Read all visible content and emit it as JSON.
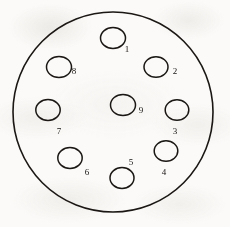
{
  "diagram": {
    "type": "connector-pin-layout",
    "stroke_color": "#1a1714",
    "fill_color": "#fbfaf8",
    "background_color": "#fbfaf8",
    "shell": {
      "label": "connector-shell-outline",
      "shape": "circle",
      "cx": 113,
      "cy": 112,
      "r": 100,
      "stroke_width": 1.6
    },
    "pins": [
      {
        "number": "1",
        "cx": 113,
        "cy": 38,
        "rx": 12.5,
        "ry": 10.5,
        "label_x": 127,
        "label_y": 52
      },
      {
        "number": "2",
        "cx": 156,
        "cy": 67,
        "rx": 12.0,
        "ry": 10.2,
        "label_x": 175,
        "label_y": 74
      },
      {
        "number": "3",
        "cx": 177,
        "cy": 110,
        "rx": 11.8,
        "ry": 10.2,
        "label_x": 175,
        "label_y": 134
      },
      {
        "number": "4",
        "cx": 166,
        "cy": 151,
        "rx": 11.8,
        "ry": 10.2,
        "label_x": 164,
        "label_y": 175
      },
      {
        "number": "5",
        "cx": 122,
        "cy": 178,
        "rx": 12.0,
        "ry": 10.4,
        "label_x": 131,
        "label_y": 165
      },
      {
        "number": "6",
        "cx": 70,
        "cy": 158,
        "rx": 12.2,
        "ry": 10.4,
        "label_x": 87,
        "label_y": 175
      },
      {
        "number": "7",
        "cx": 48,
        "cy": 110,
        "rx": 12.2,
        "ry": 10.4,
        "label_x": 59,
        "label_y": 134
      },
      {
        "number": "8",
        "cx": 59,
        "cy": 67,
        "rx": 12.5,
        "ry": 10.6,
        "label_x": 74,
        "label_y": 74
      },
      {
        "number": "9",
        "cx": 123,
        "cy": 105,
        "rx": 12.5,
        "ry": 10.6,
        "label_x": 141,
        "label_y": 113
      }
    ]
  }
}
